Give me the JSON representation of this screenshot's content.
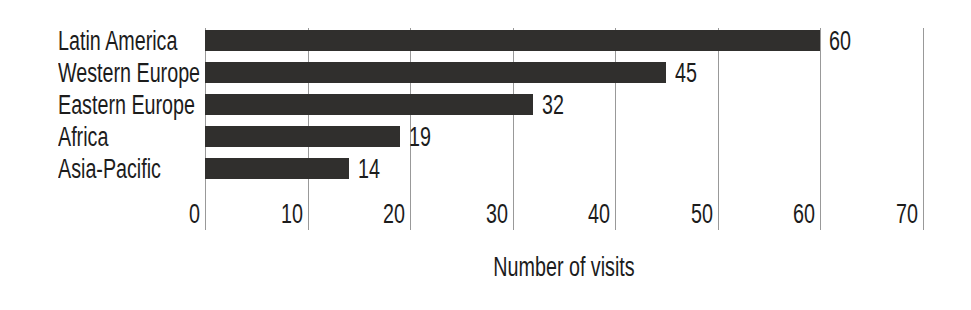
{
  "chart_data": {
    "type": "bar",
    "orientation": "horizontal",
    "categories": [
      "Latin America",
      "Western Europe",
      "Eastern Europe",
      "Africa",
      "Asia-Pacific"
    ],
    "values": [
      60,
      45,
      32,
      19,
      14
    ],
    "value_labels": [
      "60",
      "45",
      "32",
      "19",
      "14"
    ],
    "xlabel": "Number of visits",
    "xticks": [
      0,
      10,
      20,
      30,
      40,
      50,
      60,
      70
    ],
    "xlim": [
      0,
      70
    ],
    "grid": "vertical gridlines at every x tick, drawn behind bars",
    "legend": "none",
    "title": "",
    "bar_color": "#302f2d",
    "gridline_color": "#999999",
    "text_color": "#1c1c1c",
    "background_color": "#ffffff"
  }
}
